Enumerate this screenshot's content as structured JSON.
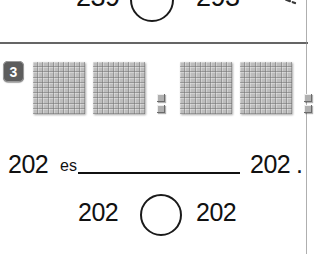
{
  "worksheet": {
    "language": "es",
    "previous_exercise": {
      "left_number": "239",
      "right_number": "293",
      "circle_answer": "<",
      "answer_mark_icon": "less-than-handwritten-icon"
    },
    "exercise": {
      "number": "3",
      "badge_color": "#5d5d5d",
      "left_model": {
        "hundreds": 2,
        "tens": 0,
        "ones": 2,
        "value": "202",
        "block_icon": "hundred-flat-icon",
        "unit_icon": "unit-cube-icon"
      },
      "right_model": {
        "hundreds": 2,
        "tens": 0,
        "ones": 2,
        "value": "202",
        "block_icon": "hundred-flat-icon",
        "unit_icon": "unit-cube-icon"
      },
      "sentence": {
        "left_number": "202",
        "verb": "es",
        "blank": "",
        "right_number": "202",
        "period": "."
      },
      "comparison": {
        "left_number": "202",
        "circle_answer": "",
        "right_number": "202"
      }
    }
  }
}
